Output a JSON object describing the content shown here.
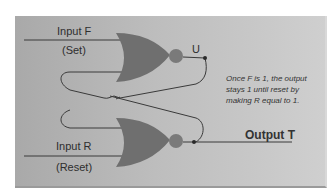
{
  "diagram": {
    "type": "SR latch (cross-coupled NOR gates)",
    "input_top": {
      "label": "Input F",
      "sublabel": "(Set)"
    },
    "input_bottom": {
      "label": "Input R",
      "sublabel": "(Reset)"
    },
    "output_top": {
      "label": "U"
    },
    "output_bottom": {
      "label": "Output T"
    },
    "note": "Once F is 1, the output stays 1 until reset by making R equal to 1.",
    "colors": {
      "panel": "#bdbdbd",
      "gate": "#6f6f6f",
      "bubble": "#7a7a7a",
      "wire": "#3a3a3a",
      "text": "#2e2e2e"
    }
  }
}
